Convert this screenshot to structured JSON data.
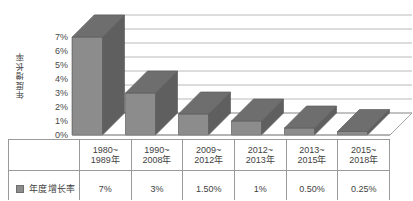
{
  "chart_data": {
    "type": "bar",
    "title": "",
    "subtitle": "",
    "xlabel": "",
    "ylabel": "年度增长率",
    "categories": [
      "1980~1989年",
      "1990~2008年",
      "2009~2012年",
      "2012~2013年",
      "2013~2015年",
      "2015~2018年"
    ],
    "categories_lines": [
      [
        "1980~",
        "1989年"
      ],
      [
        "1990~",
        "2008年"
      ],
      [
        "2009~",
        "2012年"
      ],
      [
        "2012~",
        "2013年"
      ],
      [
        "2013~",
        "2015年"
      ],
      [
        "2015~",
        "2018年"
      ]
    ],
    "values": [
      7,
      3,
      1.5,
      1,
      0.5,
      0.25
    ],
    "value_labels": [
      "7%",
      "3%",
      "1.50%",
      "1%",
      "0.50%",
      "0.25%"
    ],
    "series": [
      {
        "name": "年度增长率",
        "values": [
          7,
          3,
          1.5,
          1,
          0.5,
          0.25
        ]
      }
    ],
    "ylim": [
      0,
      7
    ],
    "ytick_values": [
      0,
      1,
      2,
      3,
      4,
      5,
      6,
      7
    ],
    "ytick_labels": [
      "0%",
      "1%",
      "2%",
      "3%",
      "4%",
      "5%",
      "6%",
      "7%"
    ],
    "grid": true,
    "legend_position": "bottom-table",
    "three_d": true,
    "colors": {
      "bar_front": "#8c8c8c",
      "bar_top": "#6e6e6e",
      "bar_side": "#5f5f5f",
      "grid_line": "#a8a8a8",
      "axis_line": "#8f8f8f",
      "plot_background": "#ffffff",
      "text": "#3f3f3f",
      "table_border": "#9a9a9a"
    }
  },
  "legend": {
    "swatch_name": "legend-swatch",
    "label": "年度增长率"
  },
  "table": {
    "row_category_header": "",
    "row_value_header": "年度增长率"
  }
}
